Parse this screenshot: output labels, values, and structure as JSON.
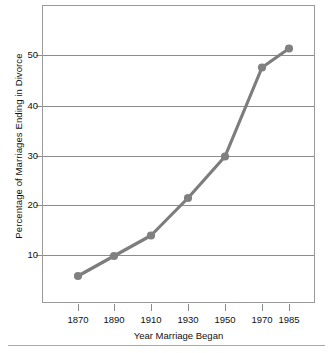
{
  "chart_data": {
    "type": "line",
    "title": "",
    "xlabel": "Year Marriage Began",
    "ylabel": "Percentage of Marriages Ending in Divorce",
    "categories": [
      "1870",
      "1890",
      "1910",
      "1930",
      "1950",
      "1970",
      "1985"
    ],
    "x": [
      1870,
      1890,
      1910,
      1930,
      1950,
      1970,
      1985
    ],
    "values": [
      5.8,
      9.8,
      13.9,
      21.4,
      29.7,
      47.5,
      51.3
    ],
    "series": [
      {
        "name": "Percentage of Marriages Ending in Divorce",
        "values": [
          5.8,
          9.8,
          13.9,
          21.4,
          29.7,
          47.5,
          51.3
        ]
      }
    ],
    "ytick_labels": [
      "10",
      "20",
      "30",
      "40",
      "50"
    ],
    "ytick_values": [
      10,
      20,
      30,
      40,
      50
    ],
    "xtick_labels": [
      "1870",
      "1890",
      "1910",
      "1930",
      "1950",
      "1970",
      "1985"
    ],
    "ylim": [
      0.2,
      59.8
    ],
    "xlim": [
      1861,
      1994
    ],
    "grid": "horizontal",
    "legend": "none",
    "marker": "filled-circle",
    "line_color": "#7d7d7d",
    "marker_color": "#808080",
    "grid_color": "#8c8c8c",
    "frame_color": "#9a9a9a",
    "background": "#ffffff"
  },
  "axes": {
    "y_title": "Percentage of Marriages Ending in Divorce",
    "x_title": "Year Marriage Began"
  }
}
